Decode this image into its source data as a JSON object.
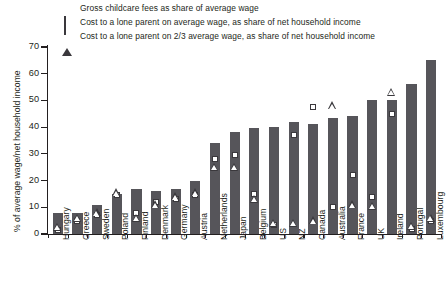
{
  "chart_data": {
    "type": "bar",
    "title": "",
    "xlabel": "",
    "ylabel": "% of average wage/net household income",
    "ylim": [
      0,
      70
    ],
    "yticks": [
      0,
      10,
      20,
      30,
      40,
      50,
      60,
      70
    ],
    "grid": false,
    "legend_position": "top",
    "categories": [
      "Hungary",
      "Greece",
      "Sweden",
      "Poland",
      "Finland",
      "Denmark",
      "Germany",
      "Austria",
      "Netherlands",
      "Japan",
      "Belgium",
      "US",
      "NZ",
      "Canada",
      "Australia",
      "France",
      "UK",
      "Ireland",
      "Portugal",
      "Luxembourg"
    ],
    "series": [
      {
        "name": "Gross childcare fees as share of average wage",
        "marker": "filled-square",
        "type": "bar",
        "values": [
          8,
          8,
          11,
          15,
          17,
          16,
          17,
          20,
          34,
          38,
          39.5,
          40,
          42,
          41,
          43.5,
          44,
          50,
          50,
          56,
          65
        ]
      },
      {
        "name": "Cost to a lone parent on average wage, as share of net household income",
        "marker": "open-square",
        "type": "scatter",
        "values": [
          1.5,
          5,
          7,
          14.5,
          8,
          12,
          13,
          14.5,
          28,
          29.5,
          15,
          3.5,
          37,
          47.5,
          10,
          22,
          14,
          45,
          2,
          5
        ]
      },
      {
        "name": "Cost to a lone parent on 2/3 average wage, as share of net household income",
        "marker": "open-triangle",
        "type": "scatter",
        "values": [
          1.5,
          5,
          7,
          14.5,
          5,
          10,
          13,
          14.5,
          24,
          24,
          12,
          3,
          3,
          4,
          47,
          10,
          9.5,
          52,
          2,
          5
        ]
      }
    ]
  },
  "legend": {
    "items": [
      {
        "marker": "filled-square",
        "label": "Gross childcare fees as share of average wage"
      },
      {
        "marker": "open-square",
        "label": "Cost to a lone parent on average wage, as share of net household income"
      },
      {
        "marker": "open-triangle",
        "label": "Cost to a lone parent on 2/3 average wage, as share of net household income"
      }
    ]
  },
  "colors": {
    "bar": "#56555a",
    "axis": "#231f20",
    "marker_stroke": "#3a383c",
    "background": "#ffffff"
  }
}
